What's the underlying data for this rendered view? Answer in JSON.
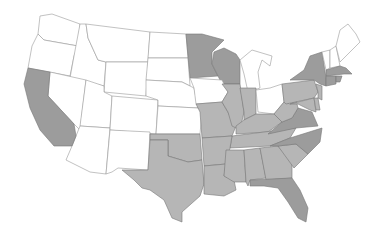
{
  "map": {
    "title": "",
    "region": "Contiguous United States",
    "legend": [],
    "colors": {
      "background": "#ffffff",
      "white_state": "#ffffff",
      "light_gray_state": "#b6b6b6",
      "dark_gray_state": "#9c9c9c",
      "border": "#777777"
    },
    "states": {
      "white": [
        "WA",
        "OR",
        "ID",
        "MT",
        "WY",
        "NV",
        "UT",
        "AZ",
        "NM",
        "CO",
        "ND",
        "SD",
        "NE",
        "KS",
        "IA",
        "MI",
        "OH",
        "ME",
        "NH",
        "VT"
      ],
      "light_gray": [
        "TX",
        "OK",
        "MO",
        "AR",
        "LA",
        "MS",
        "AL",
        "GA",
        "SC",
        "TN",
        "KY",
        "IL",
        "IN",
        "WV",
        "PA",
        "MD",
        "DE",
        "NJ"
      ],
      "dark_gray": [
        "CA",
        "MN",
        "WI",
        "NY",
        "NC",
        "VA",
        "FL",
        "MA",
        "CT",
        "RI"
      ]
    }
  }
}
